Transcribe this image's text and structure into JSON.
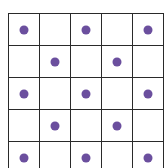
{
  "diagram": {
    "type": "dot-grid",
    "rows": 5,
    "cols": 5,
    "grid_color": "#2a2a2a",
    "dot_color": "#6b4f9e",
    "dots": [
      [
        1,
        0,
        1,
        0,
        1
      ],
      [
        0,
        1,
        0,
        1,
        0
      ],
      [
        1,
        0,
        1,
        0,
        1
      ],
      [
        0,
        1,
        0,
        1,
        0
      ],
      [
        1,
        0,
        1,
        0,
        1
      ]
    ],
    "dot_count": 13
  }
}
